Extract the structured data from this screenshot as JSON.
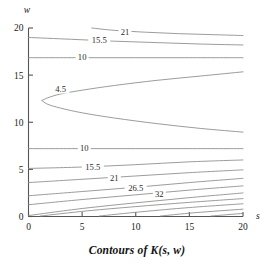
{
  "figure": {
    "caption": "Contours of K(s, w)",
    "xlabel": "s",
    "ylabel": "w",
    "line_color": "#8a8a8a",
    "axis_color": "#555555",
    "background": "#ffffff"
  },
  "axes": {
    "x_ticks": [
      "0",
      "5",
      "10",
      "15",
      "20"
    ],
    "y_ticks": [
      "0",
      "5",
      "10",
      "15",
      "20"
    ]
  },
  "labels": {
    "upper_21": "21",
    "upper_155": "15.5",
    "upper_10": "10",
    "mid_45": "4.5",
    "lower_10": "10",
    "lower_155": "15.5",
    "lower_21": "21",
    "lower_265": "26.5",
    "lower_32": "32"
  },
  "chart_data": {
    "type": "line",
    "title": "Contours of K(s, w)",
    "xlabel": "s",
    "ylabel": "w",
    "xlim": [
      0,
      20
    ],
    "ylim": [
      0,
      20
    ],
    "xticks": [
      0,
      5,
      10,
      15,
      20
    ],
    "yticks": [
      0,
      5,
      10,
      15,
      20
    ],
    "grid": false,
    "legend": "none",
    "label_style": "inline-contour-labels",
    "contours": [
      {
        "level": 21,
        "label": "21",
        "label_at": {
          "s": 9.0,
          "w": 19.5
        },
        "branch": "upper",
        "points": [
          [
            5.9,
            20.0
          ],
          [
            8.0,
            19.75
          ],
          [
            11.0,
            19.55
          ],
          [
            14.0,
            19.4
          ],
          [
            17.0,
            19.3
          ],
          [
            20.0,
            19.2
          ]
        ]
      },
      {
        "level": 15.5,
        "label": "15.5",
        "label_at": {
          "s": 6.6,
          "w": 18.7
        },
        "branch": "upper",
        "points": [
          [
            0.0,
            19.0
          ],
          [
            4.0,
            18.8
          ],
          [
            8.0,
            18.6
          ],
          [
            12.0,
            18.45
          ],
          [
            16.0,
            18.3
          ],
          [
            20.0,
            18.2
          ]
        ]
      },
      {
        "level": 10,
        "label": "10",
        "label_at": {
          "s": 5.0,
          "w": 16.9
        },
        "branch": "upper",
        "points": [
          [
            0.0,
            16.85
          ],
          [
            5.0,
            16.85
          ],
          [
            10.0,
            16.85
          ],
          [
            15.0,
            16.85
          ],
          [
            20.0,
            16.85
          ]
        ]
      },
      {
        "level": 4.5,
        "label": "4.5",
        "label_at": {
          "s": 3.0,
          "w": 13.5
        },
        "branch": "upper-of-parabola",
        "points": [
          [
            20.0,
            15.35
          ],
          [
            16.0,
            14.9
          ],
          [
            12.0,
            14.45
          ],
          [
            8.0,
            13.9
          ],
          [
            5.0,
            13.4
          ],
          [
            3.0,
            13.0
          ],
          [
            1.8,
            12.6
          ],
          [
            1.25,
            12.3
          ]
        ]
      },
      {
        "level": 4.5,
        "label": "",
        "branch": "lower-of-parabola",
        "points": [
          [
            1.25,
            12.3
          ],
          [
            1.8,
            11.9
          ],
          [
            3.0,
            11.5
          ],
          [
            5.0,
            11.0
          ],
          [
            8.0,
            10.45
          ],
          [
            12.0,
            9.85
          ],
          [
            16.0,
            9.35
          ],
          [
            20.0,
            8.95
          ]
        ]
      },
      {
        "level": 10,
        "label": "10",
        "label_at": {
          "s": 5.2,
          "w": 7.2
        },
        "branch": "lower",
        "points": [
          [
            0.0,
            7.2
          ],
          [
            5.0,
            7.2
          ],
          [
            10.0,
            7.2
          ],
          [
            15.0,
            7.2
          ],
          [
            20.0,
            7.2
          ]
        ]
      },
      {
        "level": 15.5,
        "label": "15.5",
        "label_at": {
          "s": 6.0,
          "w": 5.2
        },
        "branch": "lower",
        "points": [
          [
            0.0,
            5.1
          ],
          [
            5.0,
            5.25
          ],
          [
            10.0,
            5.5
          ],
          [
            15.0,
            5.8
          ],
          [
            20.0,
            6.0
          ]
        ]
      },
      {
        "level": 21,
        "label": "21",
        "label_at": {
          "s": 8.0,
          "w": 4.0
        },
        "branch": "lower",
        "points": [
          [
            0.0,
            3.6
          ],
          [
            5.0,
            3.95
          ],
          [
            10.0,
            4.3
          ],
          [
            15.0,
            4.65
          ],
          [
            20.0,
            4.95
          ]
        ]
      },
      {
        "level": 26.5,
        "label": "26.5",
        "label_at": {
          "s": 10.0,
          "w": 3.0
        },
        "branch": "lower",
        "points": [
          [
            0.0,
            2.2
          ],
          [
            5.0,
            2.65
          ],
          [
            10.0,
            3.1
          ],
          [
            15.0,
            3.6
          ],
          [
            20.0,
            4.05
          ]
        ]
      },
      {
        "level": 32,
        "label": "32",
        "label_at": {
          "s": 12.2,
          "w": 2.35
        },
        "branch": "lower",
        "points": [
          [
            0.0,
            1.25
          ],
          [
            5.0,
            1.8
          ],
          [
            10.0,
            2.3
          ],
          [
            15.0,
            2.8
          ],
          [
            20.0,
            3.25
          ]
        ]
      },
      {
        "level": 37.5,
        "label": "",
        "branch": "lower",
        "points": [
          [
            0.0,
            0.1
          ],
          [
            5.0,
            0.85
          ],
          [
            10.0,
            1.45
          ],
          [
            15.0,
            2.0
          ],
          [
            20.0,
            2.5
          ]
        ]
      },
      {
        "level": 43,
        "label": "",
        "branch": "lower",
        "points": [
          [
            1.1,
            0.05
          ],
          [
            5.5,
            0.6
          ],
          [
            10.0,
            1.05
          ],
          [
            15.0,
            1.5
          ],
          [
            20.0,
            1.9
          ]
        ]
      },
      {
        "level": 48.5,
        "label": "",
        "branch": "lower",
        "points": [
          [
            6.6,
            0.05
          ],
          [
            10.5,
            0.5
          ],
          [
            15.0,
            0.95
          ],
          [
            20.0,
            1.35
          ]
        ]
      },
      {
        "level": 54,
        "label": "",
        "branch": "lower",
        "points": [
          [
            12.3,
            0.05
          ],
          [
            15.5,
            0.4
          ],
          [
            20.0,
            0.78
          ]
        ]
      },
      {
        "level": 59.5,
        "label": "",
        "branch": "lower",
        "points": [
          [
            17.0,
            0.05
          ],
          [
            20.0,
            0.33
          ]
        ]
      }
    ]
  }
}
